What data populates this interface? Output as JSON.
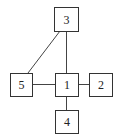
{
  "diagram": {
    "type": "graph",
    "nodes": [
      {
        "id": "1",
        "label": "1",
        "x": 55,
        "y": 73,
        "w": 23,
        "h": 23
      },
      {
        "id": "2",
        "label": "2",
        "x": 89,
        "y": 73,
        "w": 23,
        "h": 23
      },
      {
        "id": "3",
        "label": "3",
        "x": 54,
        "y": 7,
        "w": 24,
        "h": 24
      },
      {
        "id": "4",
        "label": "4",
        "x": 55,
        "y": 110,
        "w": 23,
        "h": 23
      },
      {
        "id": "5",
        "label": "5",
        "x": 10,
        "y": 73,
        "w": 22,
        "h": 23
      }
    ],
    "edges": [
      {
        "from": "3",
        "to": "1"
      },
      {
        "from": "3",
        "to": "5"
      },
      {
        "from": "5",
        "to": "1"
      },
      {
        "from": "1",
        "to": "2"
      },
      {
        "from": "1",
        "to": "4"
      }
    ]
  }
}
